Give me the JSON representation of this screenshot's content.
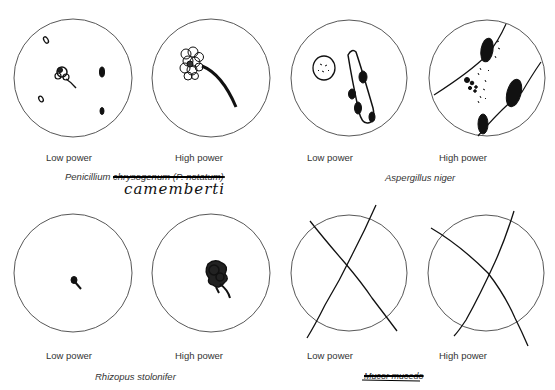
{
  "figure": {
    "type": "microscope field sketches",
    "rows": [
      {
        "specimens": [
          {
            "name_printed": "Penicillium",
            "name_struck": "chrysogenum (P. notatum)",
            "handwritten_correction": "camemberti",
            "fields": [
              {
                "label": "Low power",
                "drawing": "small brush-like conidiophore with scattered spores"
              },
              {
                "label": "High power",
                "drawing": "enlarged cluster of conidia on curved stalk"
              }
            ]
          },
          {
            "name_printed": "Aspergillus niger",
            "fields": [
              {
                "label": "Low power",
                "drawing": "oval spore mass and elongated hypha with dark patches"
              },
              {
                "label": "High power",
                "drawing": "two hyphal lines with dark conidial heads and scattered spores"
              }
            ]
          }
        ]
      },
      {
        "specimens": [
          {
            "name_printed": "Rhizopus stolonifer",
            "fields": [
              {
                "label": "Low power",
                "drawing": "tiny dark sporangium"
              },
              {
                "label": "High power",
                "drawing": "dark tangled sporangium with stalk"
              }
            ]
          },
          {
            "name_printed": "",
            "name_struck": "Mucor mucedo",
            "fields": [
              {
                "label": "Low power",
                "drawing": "crossed out (X)"
              },
              {
                "label": "High power",
                "drawing": "crossed out (X)"
              }
            ]
          }
        ]
      }
    ]
  },
  "labels": {
    "low": "Low power",
    "high": "High power",
    "penicillium": "Penicillium ",
    "penicillium_struck": "chrysogenum (P. notatum)",
    "penicillium_hand": "camemberti",
    "aspergillus": "Aspergillus niger",
    "rhizopus": "Rhizopus stolonifer",
    "mucor_struck": "Mucor mucedo"
  }
}
